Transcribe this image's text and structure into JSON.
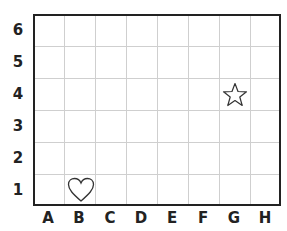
{
  "grid": {
    "columns": [
      "A",
      "B",
      "C",
      "D",
      "E",
      "F",
      "G",
      "H"
    ],
    "rows": [
      "6",
      "5",
      "4",
      "3",
      "2",
      "1"
    ]
  },
  "shapes": [
    {
      "name": "heart",
      "column": "B",
      "row": "1"
    },
    {
      "name": "star",
      "column": "G",
      "row": "4"
    }
  ],
  "colors": {
    "border": "#222222",
    "gridline": "#cfcfcf",
    "shape_stroke": "#333333"
  }
}
